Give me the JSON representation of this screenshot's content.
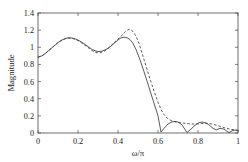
{
  "chart_data": {
    "type": "line",
    "title": "",
    "xlabel": "ω/π",
    "ylabel": "Magnitude",
    "xlim": [
      0,
      1
    ],
    "ylim": [
      0,
      1.4
    ],
    "grid": false,
    "legend_position": "none",
    "xticks": [
      0,
      0.2,
      0.4,
      0.6,
      0.8,
      1
    ],
    "xtick_labels": [
      "0",
      "0.2",
      "0.4",
      "0.6",
      "0.8",
      "1"
    ],
    "yticks": [
      0,
      0.2,
      0.4,
      0.6,
      0.8,
      1,
      1.2,
      1.4
    ],
    "ytick_labels": [
      "0",
      "0.2",
      "0.4",
      "0.6",
      "0.8",
      "1",
      "1.2",
      "1.4"
    ],
    "series": [
      {
        "name": "solid",
        "style": "solid",
        "color": "#3c3c3c",
        "x": [
          0.0,
          0.02,
          0.04,
          0.06,
          0.08,
          0.1,
          0.12,
          0.14,
          0.155,
          0.17,
          0.19,
          0.21,
          0.23,
          0.25,
          0.27,
          0.29,
          0.305,
          0.32,
          0.34,
          0.36,
          0.38,
          0.4,
          0.415,
          0.43,
          0.445,
          0.46,
          0.475,
          0.49,
          0.51,
          0.53,
          0.55,
          0.57,
          0.59,
          0.6,
          0.615,
          0.63,
          0.65,
          0.67,
          0.685,
          0.7,
          0.72,
          0.745,
          0.765,
          0.785,
          0.805,
          0.82,
          0.84,
          0.86,
          0.875,
          0.89,
          0.91,
          0.93,
          0.945,
          0.955,
          0.97,
          0.985,
          1.0
        ],
        "y": [
          0.885,
          0.9,
          0.935,
          0.975,
          1.015,
          1.055,
          1.085,
          1.105,
          1.11,
          1.108,
          1.095,
          1.072,
          1.042,
          1.008,
          0.975,
          0.955,
          0.95,
          0.955,
          0.975,
          1.005,
          1.045,
          1.085,
          1.11,
          1.118,
          1.112,
          1.09,
          1.045,
          0.975,
          0.855,
          0.715,
          0.57,
          0.42,
          0.275,
          0.2,
          0.01,
          0.055,
          0.105,
          0.13,
          0.135,
          0.128,
          0.095,
          0.005,
          0.045,
          0.09,
          0.12,
          0.128,
          0.118,
          0.085,
          0.055,
          0.035,
          0.055,
          0.045,
          0.02,
          0.005,
          0.025,
          0.035,
          0.03
        ]
      },
      {
        "name": "dashed",
        "style": "dashed",
        "color": "#3c3c3c",
        "x": [
          0.0,
          0.02,
          0.04,
          0.06,
          0.08,
          0.1,
          0.12,
          0.14,
          0.155,
          0.17,
          0.19,
          0.21,
          0.23,
          0.25,
          0.27,
          0.29,
          0.31,
          0.33,
          0.35,
          0.37,
          0.39,
          0.41,
          0.425,
          0.44,
          0.45,
          0.462,
          0.475,
          0.49,
          0.505,
          0.52,
          0.54,
          0.56,
          0.58,
          0.6,
          0.615,
          0.63,
          0.65,
          0.67,
          0.69,
          0.71,
          0.73,
          0.75,
          0.77,
          0.79,
          0.81,
          0.83,
          0.85,
          0.87,
          0.89,
          0.91,
          0.93,
          0.95,
          0.97,
          1.0
        ],
        "y": [
          0.885,
          0.9,
          0.935,
          0.975,
          1.015,
          1.055,
          1.085,
          1.103,
          1.108,
          1.105,
          1.09,
          1.065,
          1.032,
          0.998,
          0.962,
          0.938,
          0.935,
          0.952,
          0.985,
          1.03,
          1.075,
          1.118,
          1.152,
          1.19,
          1.205,
          1.208,
          1.185,
          1.13,
          1.045,
          0.935,
          0.78,
          0.63,
          0.49,
          0.36,
          0.275,
          0.215,
          0.165,
          0.14,
          0.128,
          0.122,
          0.115,
          0.108,
          0.105,
          0.105,
          0.108,
          0.112,
          0.112,
          0.105,
          0.092,
          0.078,
          0.062,
          0.05,
          0.04,
          0.032
        ]
      }
    ]
  },
  "axes": {
    "ylabel_text": "Magnitude",
    "xlabel_text": "ω/π"
  }
}
